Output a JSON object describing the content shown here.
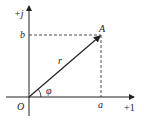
{
  "diagram": {
    "type": "complex-plane-phasor",
    "axes": {
      "imaginary_label": "+j",
      "real_label": "+1",
      "origin_label": "O"
    },
    "point": {
      "label": "A"
    },
    "projections": {
      "real": "a",
      "imaginary": "b"
    },
    "magnitude_label": "r",
    "angle_label": "φ",
    "colors": {
      "stroke": "#222222",
      "background": "#ffffff"
    }
  }
}
